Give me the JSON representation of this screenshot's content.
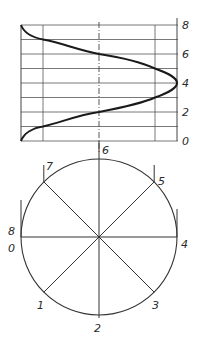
{
  "diagram": {
    "title": "",
    "graph": {
      "y_axis_labels": [
        "0",
        "2",
        "4",
        "6",
        "8"
      ],
      "y_values": [
        0,
        2,
        4,
        6,
        8
      ],
      "horizontal_divisions": 8,
      "vertical_lines": 4
    },
    "circle": {
      "division_labels": {
        "p0": "0",
        "p1": "1",
        "p2": "2",
        "p3": "3",
        "p4": "4",
        "p5": "5",
        "p6": "6",
        "p7": "7",
        "p8": "8"
      },
      "divisions": 8
    },
    "colors": {
      "line": "#333333",
      "curve": "#1a1a1a",
      "background": "#ffffff"
    }
  }
}
